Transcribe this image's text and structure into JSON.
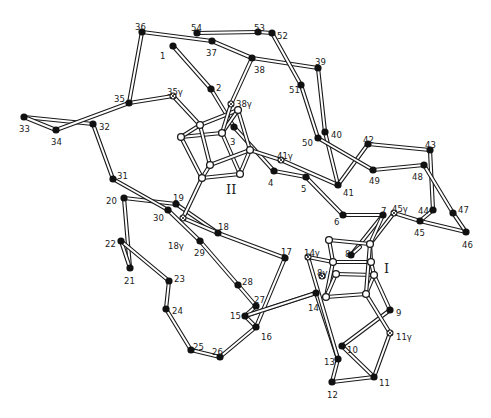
{
  "figure": {
    "type": "protein backbone stereo-style diagram with two Fe4S4 clusters",
    "cluster_labels": [
      {
        "id": "II",
        "text": "II",
        "x": 226,
        "y": 189
      },
      {
        "id": "I",
        "text": "I",
        "x": 384,
        "y": 273
      }
    ]
  },
  "nodes": [
    {
      "id": "1",
      "x": 173,
      "y": 46,
      "lx": 160,
      "ly": 56,
      "kind": "ca"
    },
    {
      "id": "2",
      "x": 211,
      "y": 89,
      "lx": 216,
      "ly": 88,
      "kind": "ca"
    },
    {
      "id": "3",
      "x": 234,
      "y": 127,
      "lx": 230,
      "ly": 142,
      "kind": "ca"
    },
    {
      "id": "4",
      "x": 274,
      "y": 171,
      "lx": 268,
      "ly": 183,
      "kind": "ca"
    },
    {
      "id": "5",
      "x": 306,
      "y": 177,
      "lx": 301,
      "ly": 189,
      "kind": "ca"
    },
    {
      "id": "6",
      "x": 343,
      "y": 215,
      "lx": 334,
      "ly": 222,
      "kind": "ca"
    },
    {
      "id": "7",
      "x": 383,
      "y": 215,
      "lx": 381,
      "ly": 211,
      "kind": "ca"
    },
    {
      "id": "8",
      "x": 351,
      "y": 255,
      "lx": 345,
      "ly": 254,
      "kind": "ca"
    },
    {
      "id": "9",
      "x": 390,
      "y": 310,
      "lx": 396,
      "ly": 313,
      "kind": "ca"
    },
    {
      "id": "10",
      "x": 342,
      "y": 346,
      "lx": 347,
      "ly": 350,
      "kind": "ca"
    },
    {
      "id": "11",
      "x": 374,
      "y": 377,
      "lx": 379,
      "ly": 383,
      "kind": "ca"
    },
    {
      "id": "12",
      "x": 332,
      "y": 382,
      "lx": 327,
      "ly": 395,
      "kind": "ca"
    },
    {
      "id": "13",
      "x": 338,
      "y": 359,
      "lx": 324,
      "ly": 362,
      "kind": "ca"
    },
    {
      "id": "14",
      "x": 316,
      "y": 293,
      "lx": 308,
      "ly": 308,
      "kind": "ca"
    },
    {
      "id": "15",
      "x": 245,
      "y": 316,
      "lx": 230,
      "ly": 316,
      "kind": "ca"
    },
    {
      "id": "16",
      "x": 256,
      "y": 327,
      "lx": 261,
      "ly": 337,
      "kind": "ca"
    },
    {
      "id": "17",
      "x": 285,
      "y": 258,
      "lx": 281,
      "ly": 252,
      "kind": "ca"
    },
    {
      "id": "18",
      "x": 218,
      "y": 233,
      "lx": 218,
      "ly": 227,
      "kind": "ca"
    },
    {
      "id": "19",
      "x": 176,
      "y": 204,
      "lx": 173,
      "ly": 198,
      "kind": "ca"
    },
    {
      "id": "20",
      "x": 124,
      "y": 198,
      "lx": 106,
      "ly": 201,
      "kind": "ca"
    },
    {
      "id": "21",
      "x": 130,
      "y": 268,
      "lx": 124,
      "ly": 281,
      "kind": "ca"
    },
    {
      "id": "22",
      "x": 121,
      "y": 241,
      "lx": 105,
      "ly": 244,
      "kind": "ca"
    },
    {
      "id": "23",
      "x": 169,
      "y": 281,
      "lx": 174,
      "ly": 279,
      "kind": "ca"
    },
    {
      "id": "24",
      "x": 166,
      "y": 309,
      "lx": 172,
      "ly": 311,
      "kind": "ca"
    },
    {
      "id": "25",
      "x": 191,
      "y": 350,
      "lx": 193,
      "ly": 347,
      "kind": "ca"
    },
    {
      "id": "26",
      "x": 220,
      "y": 357,
      "lx": 212,
      "ly": 352,
      "kind": "ca"
    },
    {
      "id": "27",
      "x": 256,
      "y": 306,
      "lx": 254,
      "ly": 300,
      "kind": "ca"
    },
    {
      "id": "28",
      "x": 238,
      "y": 285,
      "lx": 242,
      "ly": 282,
      "kind": "ca"
    },
    {
      "id": "29",
      "x": 200,
      "y": 241,
      "lx": 194,
      "ly": 253,
      "kind": "ca"
    },
    {
      "id": "30",
      "x": 168,
      "y": 210,
      "lx": 153,
      "ly": 218,
      "kind": "ca"
    },
    {
      "id": "31",
      "x": 113,
      "y": 179,
      "lx": 117,
      "ly": 176,
      "kind": "ca"
    },
    {
      "id": "32",
      "x": 93,
      "y": 124,
      "lx": 99,
      "ly": 127,
      "kind": "ca"
    },
    {
      "id": "33",
      "x": 24,
      "y": 117,
      "lx": 19,
      "ly": 129,
      "kind": "ca"
    },
    {
      "id": "34",
      "x": 56,
      "y": 130,
      "lx": 51,
      "ly": 142,
      "kind": "ca"
    },
    {
      "id": "35",
      "x": 129,
      "y": 103,
      "lx": 114,
      "ly": 99,
      "kind": "ca"
    },
    {
      "id": "36",
      "x": 142,
      "y": 32,
      "lx": 135,
      "ly": 27,
      "kind": "ca"
    },
    {
      "id": "37",
      "x": 212,
      "y": 41,
      "lx": 206,
      "ly": 53,
      "kind": "ca"
    },
    {
      "id": "38",
      "x": 252,
      "y": 58,
      "lx": 254,
      "ly": 70,
      "kind": "ca"
    },
    {
      "id": "39",
      "x": 318,
      "y": 68,
      "lx": 315,
      "ly": 62,
      "kind": "ca"
    },
    {
      "id": "40",
      "x": 325,
      "y": 132,
      "lx": 331,
      "ly": 135,
      "kind": "ca"
    },
    {
      "id": "41",
      "x": 338,
      "y": 185,
      "lx": 343,
      "ly": 193,
      "kind": "ca"
    },
    {
      "id": "42",
      "x": 368,
      "y": 144,
      "lx": 363,
      "ly": 140,
      "kind": "ca"
    },
    {
      "id": "43",
      "x": 430,
      "y": 150,
      "lx": 425,
      "ly": 145,
      "kind": "ca"
    },
    {
      "id": "44",
      "x": 433,
      "y": 210,
      "lx": 418,
      "ly": 211,
      "kind": "ca"
    },
    {
      "id": "45",
      "x": 420,
      "y": 221,
      "lx": 414,
      "ly": 233,
      "kind": "ca"
    },
    {
      "id": "46",
      "x": 466,
      "y": 232,
      "lx": 462,
      "ly": 245,
      "kind": "ca"
    },
    {
      "id": "47",
      "x": 453,
      "y": 213,
      "lx": 458,
      "ly": 210,
      "kind": "ca"
    },
    {
      "id": "48",
      "x": 424,
      "y": 165,
      "lx": 412,
      "ly": 177,
      "kind": "ca"
    },
    {
      "id": "49",
      "x": 373,
      "y": 170,
      "lx": 369,
      "ly": 181,
      "kind": "ca"
    },
    {
      "id": "50",
      "x": 318,
      "y": 138,
      "lx": 302,
      "ly": 143,
      "kind": "ca"
    },
    {
      "id": "51",
      "x": 301,
      "y": 85,
      "lx": 289,
      "ly": 90,
      "kind": "ca"
    },
    {
      "id": "52",
      "x": 272,
      "y": 33,
      "lx": 277,
      "ly": 36,
      "kind": "ca"
    },
    {
      "id": "53",
      "x": 258,
      "y": 32,
      "lx": 254,
      "ly": 28,
      "kind": "ca"
    },
    {
      "id": "54",
      "x": 197,
      "y": 33,
      "lx": 191,
      "ly": 28,
      "kind": "ca"
    },
    {
      "id": "35γ",
      "x": 173,
      "y": 96,
      "lx": 167,
      "ly": 92,
      "kind": "gamma"
    },
    {
      "id": "38γ",
      "x": 231,
      "y": 104,
      "lx": 236,
      "ly": 104,
      "kind": "gamma"
    },
    {
      "id": "41γ",
      "x": 281,
      "y": 160,
      "lx": 277,
      "ly": 156,
      "kind": "gamma"
    },
    {
      "id": "18γ",
      "x": 183,
      "y": 218,
      "lx": 168,
      "ly": 246,
      "kind": "gamma"
    },
    {
      "id": "14γ",
      "x": 308,
      "y": 257,
      "lx": 304,
      "ly": 253,
      "kind": "gamma"
    },
    {
      "id": "8γ",
      "x": 322,
      "y": 276,
      "lx": 317,
      "ly": 273,
      "kind": "gamma"
    },
    {
      "id": "45γ",
      "x": 394,
      "y": 213,
      "lx": 392,
      "ly": 209,
      "kind": "gamma"
    },
    {
      "id": "11γ",
      "x": 390,
      "y": 333,
      "lx": 396,
      "ly": 337,
      "kind": "gamma"
    }
  ],
  "cluster_atoms": {
    "II": [
      [
        200,
        125
      ],
      [
        181,
        137
      ],
      [
        222,
        133
      ],
      [
        238,
        110
      ],
      [
        250,
        150
      ],
      [
        210,
        165
      ],
      [
        202,
        178
      ],
      [
        240,
        174
      ]
    ],
    "I": [
      [
        329,
        240
      ],
      [
        370,
        244
      ],
      [
        333,
        262
      ],
      [
        371,
        262
      ],
      [
        336,
        274
      ],
      [
        374,
        275
      ],
      [
        326,
        297
      ],
      [
        366,
        294
      ]
    ]
  },
  "chain_bonds": [
    [
      "1",
      "2"
    ],
    [
      "2",
      "3"
    ],
    [
      "3",
      "4"
    ],
    [
      "4",
      "5"
    ],
    [
      "5",
      "6"
    ],
    [
      "6",
      "7"
    ],
    [
      "7",
      "8"
    ],
    [
      "9",
      "10"
    ],
    [
      "10",
      "11"
    ],
    [
      "11",
      "12"
    ],
    [
      "12",
      "13"
    ],
    [
      "13",
      "14"
    ],
    [
      "14",
      "15"
    ],
    [
      "15",
      "16"
    ],
    [
      "16",
      "17"
    ],
    [
      "17",
      "18"
    ],
    [
      "18",
      "19"
    ],
    [
      "19",
      "20"
    ],
    [
      "20",
      "21"
    ],
    [
      "21",
      "22"
    ],
    [
      "22",
      "23"
    ],
    [
      "23",
      "24"
    ],
    [
      "24",
      "25"
    ],
    [
      "25",
      "26"
    ],
    [
      "26",
      "16"
    ],
    [
      "27",
      "28"
    ],
    [
      "28",
      "29"
    ],
    [
      "29",
      "30"
    ],
    [
      "30",
      "31"
    ],
    [
      "31",
      "32"
    ],
    [
      "32",
      "33"
    ],
    [
      "33",
      "34"
    ],
    [
      "34",
      "35"
    ],
    [
      "35",
      "36"
    ],
    [
      "36",
      "37"
    ],
    [
      "37",
      "38"
    ],
    [
      "38",
      "39"
    ],
    [
      "39",
      "40"
    ],
    [
      "40",
      "41"
    ],
    [
      "41",
      "42"
    ],
    [
      "42",
      "43"
    ],
    [
      "43",
      "44"
    ],
    [
      "44",
      "45"
    ],
    [
      "45",
      "46"
    ],
    [
      "46",
      "47"
    ],
    [
      "47",
      "48"
    ],
    [
      "48",
      "49"
    ],
    [
      "49",
      "50"
    ],
    [
      "50",
      "51"
    ],
    [
      "51",
      "52"
    ],
    [
      "52",
      "53"
    ],
    [
      "53",
      "54"
    ],
    [
      "15",
      "27"
    ]
  ]
}
